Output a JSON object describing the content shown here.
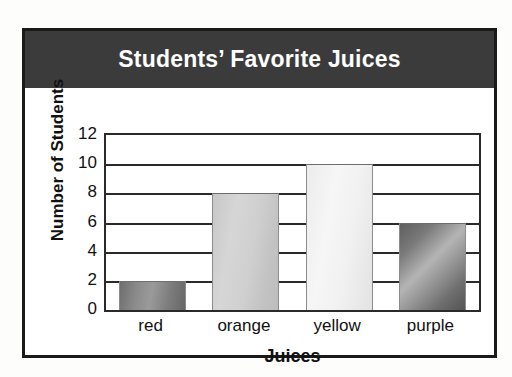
{
  "chart_data": {
    "type": "bar",
    "title": "Students’ Favorite Juices",
    "xlabel": "Juices",
    "ylabel": "Number of Students",
    "categories": [
      "red",
      "orange",
      "yellow",
      "purple"
    ],
    "values": [
      2,
      8,
      10,
      6
    ],
    "ylim": [
      0,
      12
    ],
    "ytick_step": 2,
    "ytick_labels": [
      "0",
      "2",
      "4",
      "6",
      "8",
      "10",
      "12"
    ],
    "grid": true,
    "legend": false,
    "bar_styles": [
      "g-dark",
      "g-mid",
      "g-light",
      "g-diag"
    ],
    "colors": {
      "title_band": "#3b3b3b",
      "title_text": "#ffffff",
      "frame": "#1a1a1a",
      "axis": "#2a2a2a",
      "plot_background": "#ffffff",
      "page_background": "#fdfdfc",
      "bar_red": "#8b8b8b",
      "bar_orange": "#cfcfcf",
      "bar_yellow": "#f1f1f1",
      "bar_purple": "#7a7a7a"
    }
  }
}
